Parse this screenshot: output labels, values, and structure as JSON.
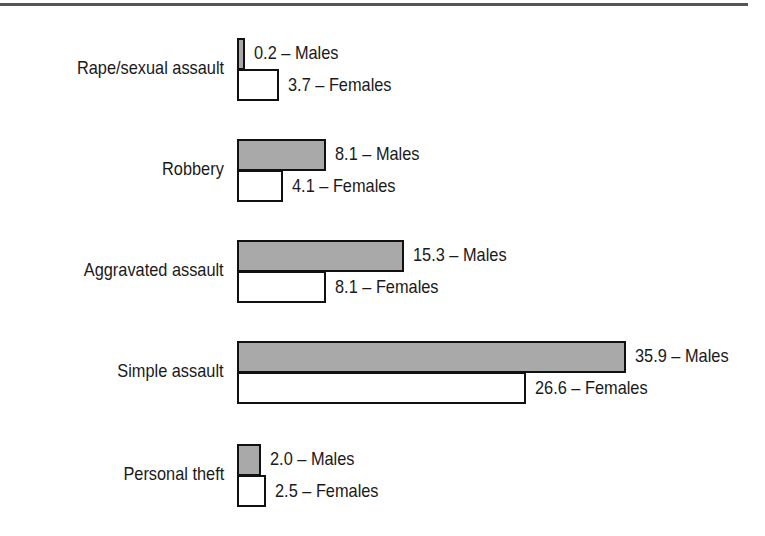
{
  "chart_data": {
    "type": "bar",
    "orientation": "horizontal",
    "title": "",
    "xlabel": "",
    "ylabel": "",
    "categories": [
      "Rape/sexual assault",
      "Robbery",
      "Aggravated assault",
      "Simple assault",
      "Personal theft"
    ],
    "series": [
      {
        "name": "Males",
        "values": [
          0.2,
          8.1,
          15.3,
          35.9,
          2.0
        ],
        "color": "#a9a9a9"
      },
      {
        "name": "Females",
        "values": [
          3.7,
          4.1,
          8.1,
          26.6,
          2.5
        ],
        "color": "#ffffff"
      }
    ],
    "data_labels": {
      "males": [
        "0.2 – Males",
        "8.1 – Males",
        "15.3 – Males",
        "35.9 – Males",
        "2.0 – Males"
      ],
      "females": [
        "3.7 – Females",
        "4.1 – Females",
        "8.1 – Females",
        "26.6 – Females",
        "2.5 – Females"
      ]
    },
    "grid": false,
    "legend": "none (series named in data labels)"
  },
  "groups": [
    {
      "label": "Rape/sexual assault",
      "male": 0.2,
      "female": 3.7,
      "male_text": "0.2 – Males",
      "female_text": "3.7 – Females"
    },
    {
      "label": "Robbery",
      "male": 8.1,
      "female": 4.1,
      "male_text": "8.1 – Males",
      "female_text": "4.1 – Females"
    },
    {
      "label": "Aggravated assault",
      "male": 15.3,
      "female": 8.1,
      "male_text": "15.3 – Males",
      "female_text": "8.1 – Females"
    },
    {
      "label": "Simple assault",
      "male": 35.9,
      "female": 26.6,
      "male_text": "35.9 – Males",
      "female_text": "26.6 – Females"
    },
    {
      "label": "Personal theft",
      "male": 2.0,
      "female": 2.5,
      "male_text": "2.0 – Males",
      "female_text": "2.5 – Females"
    }
  ]
}
